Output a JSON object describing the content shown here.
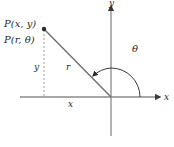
{
  "diagram": {
    "point_labels": {
      "rectangular": "P(x, y)",
      "polar": "P(r, θ)"
    },
    "axis_labels": {
      "x_axis": "x",
      "y_axis": "y"
    },
    "segment_labels": {
      "radius": "r",
      "vertical_leg": "y",
      "horizontal_leg": "x"
    },
    "angle_label": "θ",
    "colors": {
      "axis": "#8a8a8a",
      "radius_line": "#6e6e6e",
      "dashed_leg": "#9a9a9a",
      "arc": "#3a3a3a",
      "point": "#2a2a2a",
      "text": "#2a2a2a"
    }
  }
}
